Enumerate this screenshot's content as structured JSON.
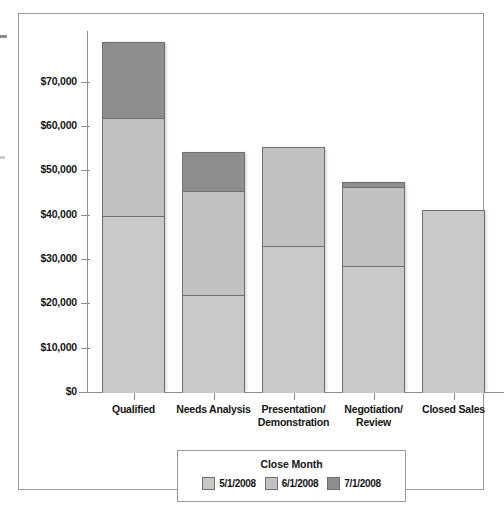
{
  "chart_data": {
    "type": "bar",
    "stacked": true,
    "title": "",
    "xlabel": "",
    "ylabel": "",
    "ylim": [
      0,
      80000
    ],
    "yticks": [
      0,
      10000,
      20000,
      30000,
      40000,
      50000,
      60000,
      70000
    ],
    "ytick_labels": [
      "$0",
      "$10,000",
      "$20,000",
      "$30,000",
      "$40,000",
      "$50,000",
      "$60,000",
      "$70,000"
    ],
    "grid": false,
    "legend_title": "Close Month",
    "legend_position": "bottom",
    "categories": [
      "Qualified",
      "Needs Analysis",
      "Presentation/\nDemonstration",
      "Negotiation/\nReview",
      "Closed Sales"
    ],
    "series": [
      {
        "name": "5/1/2008",
        "color": "#c9c9c9",
        "values": [
          39800,
          21900,
          33000,
          28500,
          41000
        ]
      },
      {
        "name": "6/1/2008",
        "color": "#c2c2c2",
        "values": [
          22000,
          23400,
          22200,
          17700,
          0
        ]
      },
      {
        "name": "7/1/2008",
        "color": "#8e8e8e",
        "values": [
          17200,
          8800,
          0,
          1300,
          0
        ]
      }
    ],
    "totals": [
      79000,
      54100,
      55200,
      47500,
      41000
    ]
  },
  "axis": {
    "ticks": [
      {
        "label": "$70,000",
        "value": 70000
      },
      {
        "label": "$60,000",
        "value": 60000
      },
      {
        "label": "$50,000",
        "value": 50000
      },
      {
        "label": "$40,000",
        "value": 40000
      },
      {
        "label": "$30,000",
        "value": 30000
      },
      {
        "label": "$20,000",
        "value": 20000
      },
      {
        "label": "$10,000",
        "value": 10000
      },
      {
        "label": "$0",
        "value": 0
      }
    ]
  },
  "categories": [
    {
      "line1": "Qualified",
      "line2": ""
    },
    {
      "line1": "Needs Analysis",
      "line2": ""
    },
    {
      "line1": "Presentation/",
      "line2": "Demonstration"
    },
    {
      "line1": "Negotiation/",
      "line2": "Review"
    },
    {
      "line1": "Closed Sales",
      "line2": ""
    }
  ],
  "legend": {
    "title": "Close Month",
    "items": [
      {
        "label": "5/1/2008",
        "color": "#c9c9c9"
      },
      {
        "label": "6/1/2008",
        "color": "#c2c2c2"
      },
      {
        "label": "7/1/2008",
        "color": "#8e8e8e"
      }
    ]
  },
  "colors": {
    "frame": "#9a9a9a",
    "axis": "#8e8e8e",
    "bar_outline": "#6e6e6e",
    "text": "#141414",
    "background": "#ffffff"
  }
}
